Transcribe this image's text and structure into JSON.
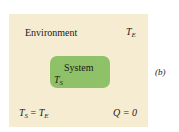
{
  "diagram": {
    "environment": {
      "label": "Environment",
      "temp_symbol": "T",
      "temp_subscript": "E",
      "fill_color": "#f6ecd2"
    },
    "system": {
      "label": "System",
      "temp_symbol": "T",
      "temp_subscript": "S",
      "fill_color": "#8fc268"
    },
    "equations": {
      "equilibrium": {
        "lhs": "T",
        "lhs_sub": "S",
        "op": " = ",
        "rhs": "T",
        "rhs_sub": "E"
      },
      "heat": "Q = 0"
    },
    "panel_label": "(b)"
  }
}
